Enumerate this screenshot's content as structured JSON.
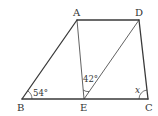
{
  "diagram": {
    "type": "geometry-trapezoid",
    "vertices": {
      "A": {
        "label": "A"
      },
      "D": {
        "label": "D"
      },
      "B": {
        "label": "B"
      },
      "E": {
        "label": "E"
      },
      "C": {
        "label": "C"
      }
    },
    "segments": [
      "AD",
      "AB",
      "BC",
      "DC",
      "AE",
      "DE"
    ],
    "angles": {
      "B": {
        "label": "54°",
        "between": [
          "BC",
          "BA"
        ]
      },
      "E": {
        "label": "42°",
        "between": [
          "EA",
          "ED"
        ]
      },
      "C": {
        "label": "x",
        "between": [
          "CB",
          "CD"
        ]
      }
    }
  }
}
